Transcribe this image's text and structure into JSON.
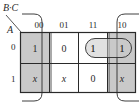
{
  "kmap": {
    "row_var": "A",
    "col_var": "B·C",
    "col_headers": [
      "00",
      "01",
      "11",
      "10"
    ],
    "row_headers": [
      "0",
      "1"
    ],
    "cells": [
      [
        "1",
        "0",
        "1",
        "1"
      ],
      [
        "x",
        "x",
        "0",
        "x"
      ]
    ],
    "groups": [
      {
        "name": "wraparound-group",
        "cells": [
          [
            0,
            0
          ],
          [
            1,
            0
          ],
          [
            0,
            3
          ],
          [
            1,
            3
          ]
        ],
        "shaded": true
      },
      {
        "name": "pair-group",
        "cells": [
          [
            0,
            2
          ],
          [
            0,
            3
          ]
        ],
        "shape": "rounded-rect"
      }
    ],
    "colors": {
      "shade": "#c9c9c9",
      "line": "#2a2a2a"
    }
  }
}
